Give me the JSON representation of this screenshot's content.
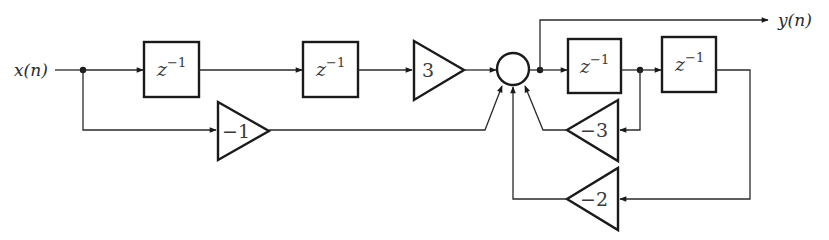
{
  "diagram": {
    "type": "signal-flow block diagram",
    "input": {
      "label": "x(n)"
    },
    "output": {
      "label": "y(n)"
    },
    "delays": [
      {
        "id": "delay-1",
        "label_base": "z",
        "label_exp": "−1"
      },
      {
        "id": "delay-2",
        "label_base": "z",
        "label_exp": "−1"
      },
      {
        "id": "delay-3",
        "label_base": "z",
        "label_exp": "−1"
      },
      {
        "id": "delay-4",
        "label_base": "z",
        "label_exp": "−1"
      }
    ],
    "gains": [
      {
        "id": "gain-forward-3",
        "label": "3"
      },
      {
        "id": "gain-forward-neg1",
        "label": "−1"
      },
      {
        "id": "gain-feedback-neg3",
        "label": "−3"
      },
      {
        "id": "gain-feedback-neg2",
        "label": "−2"
      }
    ],
    "adder": {
      "id": "summing-node",
      "inputs": 4
    },
    "connections": [
      "x(n) -> z^-1 -> z^-1 -> 3 -> summer",
      "x(n) -> -1 -> summer",
      "summer -> y(n)",
      "summer -> z^-1 -> z^-1",
      "after first feedback z^-1 -> -3 -> summer",
      "after second feedback z^-1 -> -2 -> summer"
    ]
  }
}
